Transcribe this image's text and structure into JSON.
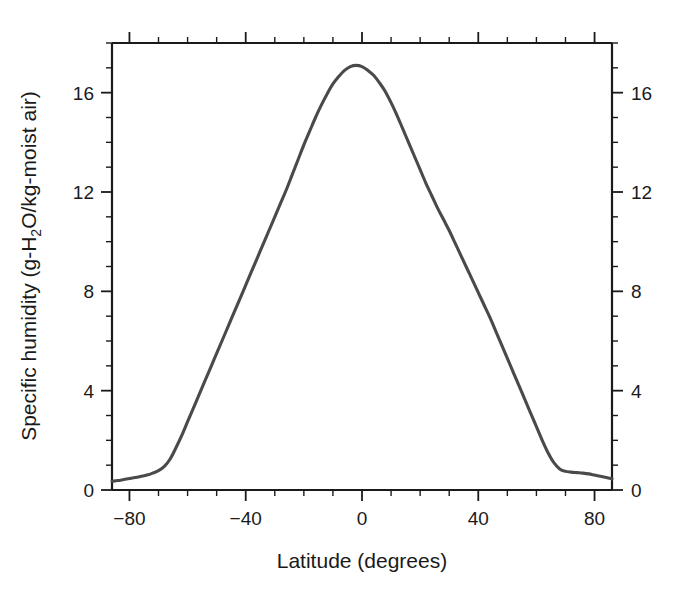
{
  "chart_data": {
    "type": "line",
    "title": "",
    "subtitle": "",
    "xlabel": "Latitude (degrees)",
    "ylabel": "Specific humidity (g-H₂O/kg-moist air)",
    "ylabel_parts": {
      "pre": "Specific humidity (g-H",
      "subscript": "2",
      "post": "O/kg-moist air)"
    },
    "xlim": [
      -86,
      86
    ],
    "ylim": [
      0,
      18
    ],
    "grid": false,
    "legend": null,
    "line_color": "#4a4a4a",
    "axis_color": "#1a1a1a",
    "background_color": "#ffffff",
    "x_major_ticks": [
      -80,
      -40,
      0,
      40,
      80
    ],
    "x_major_tick_labels": [
      "−80",
      "−40",
      "0",
      "40",
      "80"
    ],
    "x_minor_tick_step": 10,
    "y_major_ticks": [
      0,
      4,
      8,
      12,
      16
    ],
    "y_major_tick_labels": [
      "0",
      "4",
      "8",
      "12",
      "16"
    ],
    "y_minor_tick_step": 1,
    "y_axis_left_labels": [
      "0",
      "4",
      "8",
      "12",
      "16"
    ],
    "y_axis_right_labels": [
      "0",
      "4",
      "8",
      "12",
      "16"
    ],
    "mirrored_axes": true,
    "tick_direction": "out",
    "series": [
      {
        "name": "Zonal mean specific humidity",
        "x": [
          -86,
          -84,
          -82,
          -80,
          -78,
          -76,
          -74,
          -72,
          -70,
          -68,
          -66,
          -64,
          -62,
          -60,
          -58,
          -56,
          -54,
          -52,
          -50,
          -48,
          -46,
          -44,
          -42,
          -40,
          -38,
          -36,
          -34,
          -32,
          -30,
          -28,
          -26,
          -24,
          -22,
          -20,
          -18,
          -16,
          -14,
          -12,
          -10,
          -8,
          -6,
          -4,
          -2,
          0,
          2,
          4,
          6,
          8,
          10,
          12,
          14,
          16,
          18,
          20,
          22,
          24,
          26,
          28,
          30,
          32,
          34,
          36,
          38,
          40,
          42,
          44,
          46,
          48,
          50,
          52,
          54,
          56,
          58,
          60,
          62,
          64,
          66,
          68,
          70,
          72,
          74,
          76,
          78,
          80,
          82,
          84,
          86
        ],
        "y": [
          0.35,
          0.38,
          0.42,
          0.46,
          0.5,
          0.55,
          0.6,
          0.68,
          0.78,
          0.95,
          1.25,
          1.7,
          2.2,
          2.75,
          3.3,
          3.85,
          4.4,
          4.95,
          5.5,
          6.05,
          6.6,
          7.15,
          7.7,
          8.25,
          8.8,
          9.35,
          9.9,
          10.45,
          11.0,
          11.55,
          12.1,
          12.7,
          13.3,
          13.9,
          14.45,
          15.0,
          15.5,
          15.95,
          16.35,
          16.65,
          16.9,
          17.05,
          17.1,
          17.05,
          16.9,
          16.7,
          16.4,
          16.05,
          15.6,
          15.1,
          14.55,
          14.0,
          13.45,
          12.9,
          12.35,
          11.85,
          11.35,
          10.9,
          10.45,
          9.95,
          9.45,
          8.95,
          8.45,
          7.95,
          7.45,
          6.95,
          6.4,
          5.85,
          5.3,
          4.75,
          4.2,
          3.65,
          3.1,
          2.55,
          2.0,
          1.5,
          1.1,
          0.85,
          0.75,
          0.72,
          0.7,
          0.68,
          0.65,
          0.6,
          0.55,
          0.5,
          0.45
        ]
      }
    ],
    "annotations": [],
    "peak": {
      "x": 0,
      "y": 17.1,
      "note": "maximum specific humidity near the equator"
    }
  }
}
